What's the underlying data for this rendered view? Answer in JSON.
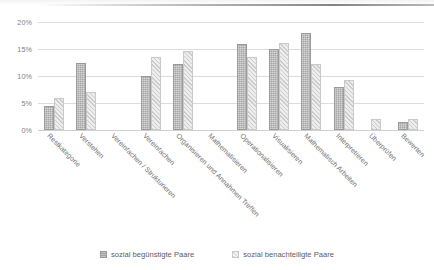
{
  "chart_data": {
    "type": "bar",
    "title": "",
    "xlabel": "",
    "ylabel": "",
    "ylim": [
      0,
      20
    ],
    "ytick_labels": [
      "0%",
      "5%",
      "10%",
      "15%",
      "20%"
    ],
    "ytick_values": [
      0,
      5,
      10,
      15,
      20
    ],
    "grid": true,
    "legend_position": "bottom",
    "categories": [
      "Restkategorie",
      "Verstehen",
      "Vereinfachen / Strukturieren",
      "Vereinfachen",
      "Organisieren und Annahmen Treffen",
      "Mathematisieren",
      "Operationalisieren",
      "Visualisieren",
      "Mathematisch Arbeiten",
      "Interpretieren",
      "Überprüfen",
      "Bewerten"
    ],
    "series": [
      {
        "name": "sozial begünstigte Paare",
        "color": "#a5a5a5",
        "values": [
          4.5,
          12.5,
          0,
          10.0,
          12.3,
          0,
          16.0,
          15.0,
          18.0,
          8.0,
          0,
          1.5
        ]
      },
      {
        "name": "sozial benachteiligte Paare",
        "color": "#ededed",
        "values": [
          6.0,
          7.0,
          0,
          13.5,
          14.7,
          0,
          13.5,
          16.2,
          12.3,
          9.3,
          2.0,
          2.0
        ]
      }
    ]
  },
  "legend": {
    "items": [
      {
        "label": "sozial begünstigte Paare",
        "swatch": "dark"
      },
      {
        "label": "sozial benachteiligte Paare",
        "swatch": "light"
      }
    ]
  }
}
